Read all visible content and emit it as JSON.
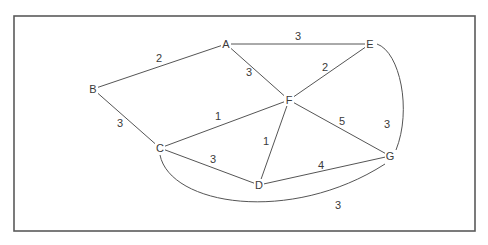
{
  "graph": {
    "type": "weighted-undirected-graph",
    "nodes": [
      {
        "id": "A",
        "label": "A"
      },
      {
        "id": "B",
        "label": "B"
      },
      {
        "id": "C",
        "label": "C"
      },
      {
        "id": "D",
        "label": "D"
      },
      {
        "id": "E",
        "label": "E"
      },
      {
        "id": "F",
        "label": "F"
      },
      {
        "id": "G",
        "label": "G"
      }
    ],
    "edges": [
      {
        "from": "A",
        "to": "B",
        "weight": "2"
      },
      {
        "from": "A",
        "to": "E",
        "weight": "3"
      },
      {
        "from": "A",
        "to": "F",
        "weight": "3"
      },
      {
        "from": "B",
        "to": "C",
        "weight": "3"
      },
      {
        "from": "E",
        "to": "F",
        "weight": "2"
      },
      {
        "from": "E",
        "to": "G",
        "weight": "3"
      },
      {
        "from": "C",
        "to": "F",
        "weight": "1"
      },
      {
        "from": "C",
        "to": "D",
        "weight": "3"
      },
      {
        "from": "C",
        "to": "G",
        "weight": "3"
      },
      {
        "from": "D",
        "to": "F",
        "weight": "1"
      },
      {
        "from": "D",
        "to": "G",
        "weight": "4"
      },
      {
        "from": "F",
        "to": "G",
        "weight": "5"
      }
    ]
  }
}
